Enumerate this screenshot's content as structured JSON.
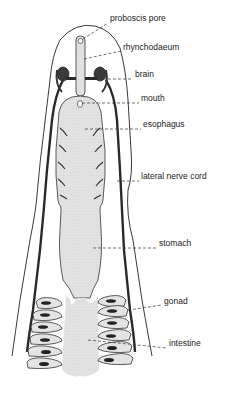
{
  "diagram": {
    "colors": {
      "ink": "#222222",
      "stipple": "#d4d4d4",
      "gut_fill": "#e2e2e2",
      "background": "#ffffff"
    },
    "labels": [
      {
        "id": "proboscis-pore",
        "text": "proboscis pore",
        "x": 110,
        "y": 18
      },
      {
        "id": "rhynchodaeum",
        "text": "rhynchodaeum",
        "x": 123,
        "y": 47
      },
      {
        "id": "brain",
        "text": "brain",
        "x": 135,
        "y": 74
      },
      {
        "id": "mouth",
        "text": "mouth",
        "x": 141,
        "y": 98
      },
      {
        "id": "esophagus",
        "text": "esophagus",
        "x": 143,
        "y": 124
      },
      {
        "id": "lateral-nerve-cord",
        "text": "lateral nerve cord",
        "x": 141,
        "y": 176
      },
      {
        "id": "stomach",
        "text": "stomach",
        "x": 159,
        "y": 243
      },
      {
        "id": "gonad",
        "text": "gonad",
        "x": 164,
        "y": 301
      },
      {
        "id": "intestine",
        "text": "intestine",
        "x": 169,
        "y": 343
      }
    ]
  }
}
